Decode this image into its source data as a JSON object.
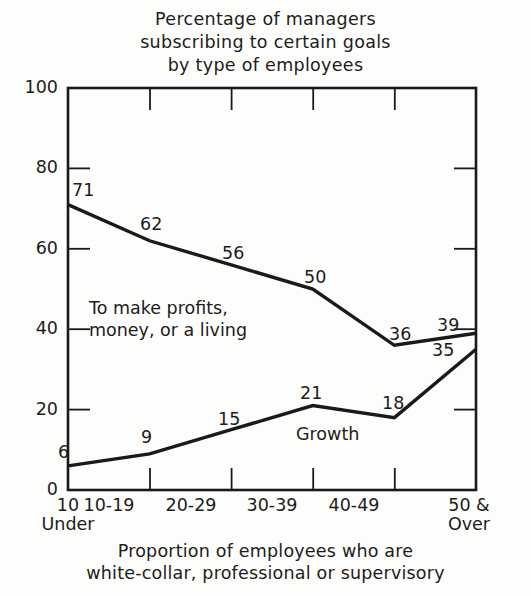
{
  "chart_data": {
    "type": "line",
    "title": "Percentage of managers subscribing to certain goals by type of employees",
    "title_lines": [
      "Percentage of managers",
      "subscribing to certain goals",
      "by type of employees"
    ],
    "xlabel": "Proportion of employees who are white-collar, professional or supervisory",
    "xlabel_lines": [
      "Proportion of employees who are",
      "white-collar, professional or supervisory"
    ],
    "ylabel": "",
    "ylim": [
      0,
      100
    ],
    "yticks": [
      0,
      20,
      40,
      60,
      80,
      100
    ],
    "ytick_labels": [
      "0",
      "20",
      "40",
      "60",
      "80",
      "100"
    ],
    "grid": false,
    "legend": "inline-annotations",
    "categories": [
      "10 Under",
      "10-19",
      "20-29",
      "30-39",
      "40-49",
      "50 & Over"
    ],
    "category_labels": [
      {
        "main": "10",
        "sub": "Under"
      },
      {
        "main": "10-19",
        "sub": ""
      },
      {
        "main": "20-29",
        "sub": ""
      },
      {
        "main": "30-39",
        "sub": ""
      },
      {
        "main": "40-49",
        "sub": ""
      },
      {
        "main": "50 &",
        "sub": "Over"
      }
    ],
    "series": [
      {
        "name": "To make profits, money, or a living",
        "name_lines": [
          "To make profits,",
          "money, or a living"
        ],
        "values": [
          71,
          62,
          56,
          50,
          36,
          39
        ],
        "color": "#1a1a1a"
      },
      {
        "name": "Growth",
        "name_lines": [
          "Growth"
        ],
        "values": [
          6,
          9,
          15,
          21,
          18,
          35
        ],
        "color": "#1a1a1a"
      }
    ]
  },
  "style": {
    "axis_color": "#1a1a1a",
    "line_color": "#1a1a1a",
    "text_color": "#1c1c1c",
    "background": "#fdfdfb"
  }
}
